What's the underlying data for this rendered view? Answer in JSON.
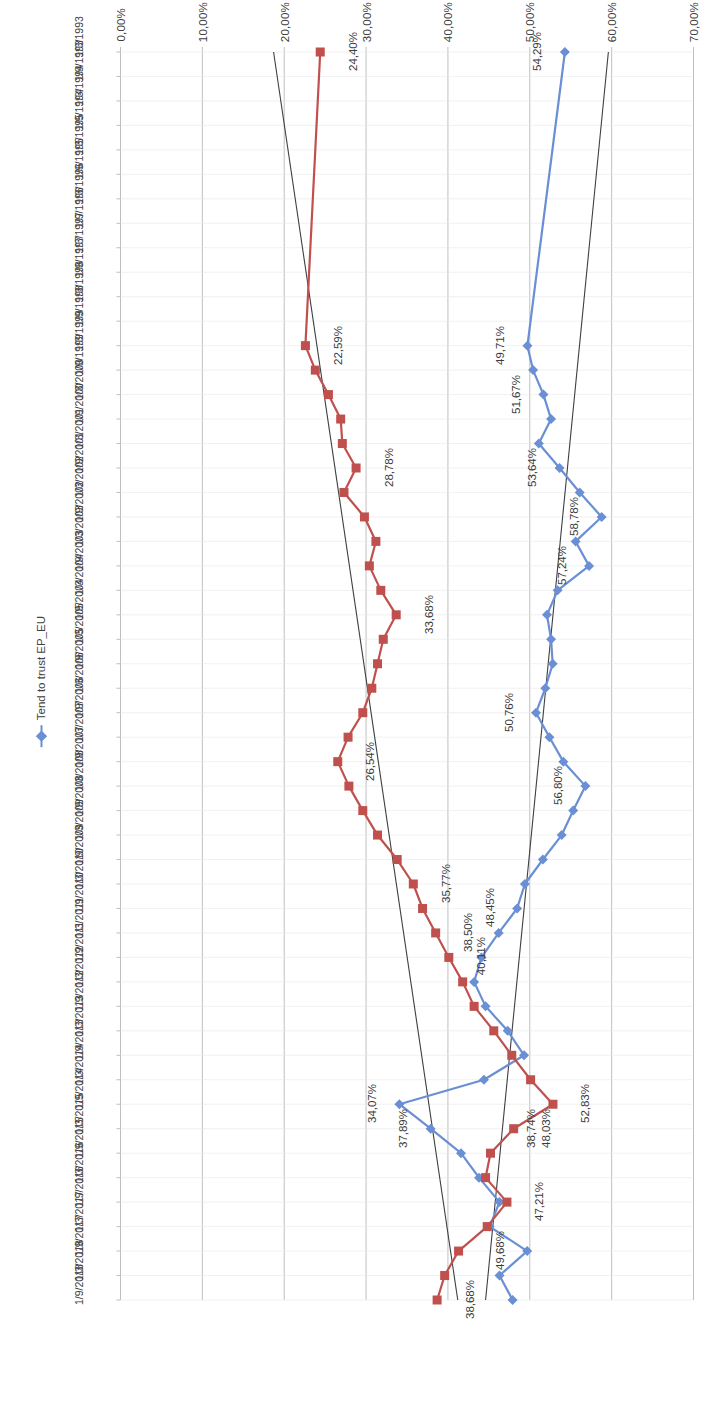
{
  "chart_data": {
    "type": "line",
    "title": "",
    "xlabel": "",
    "ylabel": "",
    "ylim": [
      0,
      70
    ],
    "ytick_labels": [
      "70,00%",
      "60,00%",
      "50,00%",
      "40,00%",
      "30,00%",
      "20,00%",
      "10,00%",
      "0,00%"
    ],
    "ytick_values": [
      70,
      60,
      50,
      40,
      30,
      20,
      10,
      0
    ],
    "grid": true,
    "legend_position": "bottom",
    "legend": [
      "Tend to trust EP_EU"
    ],
    "trendlines": [
      {
        "name": "blue-trendline",
        "color": "#3F3F3F",
        "from": {
          "x": 0,
          "y": 59.6
        },
        "to": {
          "x": 51,
          "y": 44.6
        }
      },
      {
        "name": "red-trendline",
        "color": "#3F3F3F",
        "from": {
          "x": 0,
          "y": 18.7
        },
        "to": {
          "x": 51,
          "y": 41.2
        }
      }
    ],
    "categories": [
      "1/3/1993",
      "1/9/1993",
      "1/3/1994",
      "1/9/1994",
      "1/3/1995",
      "1/9/1995",
      "1/3/1996",
      "1/9/1996",
      "1/3/1997",
      "1/9/1997",
      "1/3/1998",
      "1/9/1998",
      "1/3/1999",
      "1/9/1999",
      "1/3/2000",
      "1/9/2000",
      "1/3/2001",
      "1/9/2001",
      "1/3/2002",
      "1/9/2002",
      "1/3/2003",
      "1/9/2003",
      "1/3/2004",
      "1/9/2004",
      "1/3/2005",
      "1/9/2005",
      "1/3/2006",
      "1/9/2006",
      "1/3/2007",
      "1/9/2007",
      "1/3/2008",
      "1/9/2008",
      "1/3/2009",
      "1/9/2009",
      "1/3/2010",
      "1/9/2010",
      "1/3/2011",
      "1/9/2011",
      "1/3/2012",
      "1/9/2012",
      "1/3/2013",
      "1/9/2013",
      "1/3/2014",
      "1/9/2014",
      "1/3/2015",
      "1/9/2015",
      "1/3/2016",
      "1/9/2016",
      "1/3/2017",
      "1/9/2017",
      "1/3/2018",
      "1/9/2018"
    ],
    "series": [
      {
        "name": "Tend to trust EP_EU",
        "color": "#6A8FD4",
        "marker": "diamond",
        "values": [
          54.29,
          null,
          null,
          null,
          null,
          null,
          null,
          null,
          null,
          null,
          null,
          null,
          49.71,
          50.4,
          51.67,
          52.6,
          51.1,
          53.64,
          56.1,
          58.78,
          55.6,
          57.24,
          53.4,
          52.1,
          52.6,
          52.8,
          51.9,
          50.76,
          52.4,
          54.1,
          56.8,
          55.3,
          53.9,
          51.6,
          49.4,
          48.45,
          46.2,
          44.1,
          43.2,
          44.6,
          47.3,
          49.3,
          44.4,
          34.07,
          37.89,
          41.6,
          43.8,
          46.3,
          45.1,
          49.68,
          46.3,
          47.9
        ]
      },
      {
        "name": "Tend not to trust EP_EU",
        "color": "#C0504D",
        "marker": "square",
        "values": [
          24.4,
          null,
          null,
          null,
          null,
          null,
          null,
          null,
          null,
          null,
          null,
          null,
          22.59,
          23.8,
          25.4,
          26.9,
          27.1,
          28.78,
          27.3,
          29.8,
          31.2,
          30.4,
          31.8,
          33.68,
          32.1,
          31.4,
          30.7,
          29.6,
          27.8,
          26.54,
          27.9,
          29.6,
          31.4,
          33.8,
          35.77,
          36.9,
          38.5,
          40.11,
          41.8,
          43.2,
          45.6,
          47.8,
          50.1,
          52.83,
          48.03,
          45.2,
          44.6,
          47.21,
          44.8,
          41.3,
          39.6,
          38.68
        ]
      }
    ],
    "data_labels": [
      {
        "series": "Tend to trust EP_EU",
        "category": "1/3/1993",
        "text": "54,29%"
      },
      {
        "series": "Tend to trust EP_EU",
        "category": "1/3/1999",
        "text": "49,71%"
      },
      {
        "series": "Tend to trust EP_EU",
        "category": "1/3/2000",
        "text": "51,67%"
      },
      {
        "series": "Tend to trust EP_EU",
        "category": "1/9/2001",
        "text": "53,64%"
      },
      {
        "series": "Tend to trust EP_EU",
        "category": "1/9/2002",
        "text": "58,78%"
      },
      {
        "series": "Tend to trust EP_EU",
        "category": "1/9/2003",
        "text": "57,24%"
      },
      {
        "series": "Tend to trust EP_EU",
        "category": "1/9/2006",
        "text": "50,76%"
      },
      {
        "series": "Tend to trust EP_EU",
        "category": "1/3/2008",
        "text": "56,80%"
      },
      {
        "series": "Tend to trust EP_EU",
        "category": "1/9/2010",
        "text": "48,45%"
      },
      {
        "series": "Tend to trust EP_EU",
        "category": "1/9/2014",
        "text": "34,07%"
      },
      {
        "series": "Tend to trust EP_EU",
        "category": "1/3/2015",
        "text": "37,89%"
      },
      {
        "series": "Tend to trust EP_EU",
        "category": "1/9/2017",
        "text": "49,68%"
      },
      {
        "series": "Tend not to trust EP_EU",
        "category": "1/3/1993",
        "text": "24,40%"
      },
      {
        "series": "Tend not to trust EP_EU",
        "category": "1/3/1999",
        "text": "22,59%"
      },
      {
        "series": "Tend not to trust EP_EU",
        "category": "1/9/2001",
        "text": "28,78%"
      },
      {
        "series": "Tend not to trust EP_EU",
        "category": "1/9/2004",
        "text": "33,68%"
      },
      {
        "series": "Tend not to trust EP_EU",
        "category": "1/9/2007",
        "text": "26,54%"
      },
      {
        "series": "Tend not to trust EP_EU",
        "category": "1/3/2010",
        "text": "35,77%"
      },
      {
        "series": "Tend not to trust EP_EU",
        "category": "1/3/2011",
        "text": "38,50%"
      },
      {
        "series": "Tend not to trust EP_EU",
        "category": "1/9/2011",
        "text": "40,11%"
      },
      {
        "series": "Tend not to trust EP_EU",
        "category": "1/9/2014",
        "text": "52,83%"
      },
      {
        "series": "Tend not to trust EP_EU",
        "category": "1/3/2015",
        "text": "48,03%"
      },
      {
        "series": "Tend not to trust EP_EU",
        "category": "1/9/2016",
        "text": "47,21%"
      },
      {
        "series": "Tend not to trust EP_EU",
        "category": "1/9/2018",
        "text": "38,68%"
      },
      {
        "series": "trendline",
        "category": "1/3/2015",
        "text": "38,74%"
      }
    ]
  }
}
